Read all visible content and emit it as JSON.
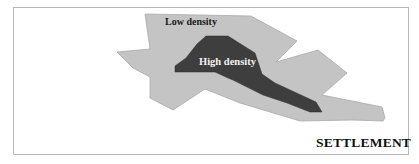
{
  "diagram": {
    "title": "SETTLEMENT",
    "zones": [
      {
        "label": "Low density",
        "fill": "#c4c4c4"
      },
      {
        "label": "High density",
        "fill": "#3e3e3e"
      }
    ],
    "border_color": "#b8b8b8"
  }
}
